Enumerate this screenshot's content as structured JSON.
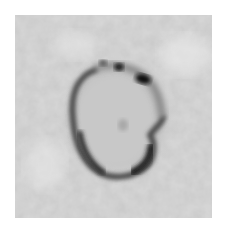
{
  "image": {
    "kind": "grayscale micrograph",
    "subject": "ring-shaped dark particle on noisy gray background",
    "colors": {
      "background": "#ffffff",
      "field": "#cfcfcf",
      "ring": "#3a3a3a",
      "dark_spot": "#111111",
      "interior": "#c4c4c4"
    }
  }
}
